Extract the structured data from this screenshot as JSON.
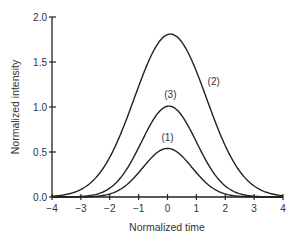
{
  "chart_data": {
    "type": "line",
    "title": "",
    "xlabel": "Normalized time",
    "ylabel": "Normalized intensity",
    "xlim": [
      -4,
      4
    ],
    "ylim": [
      0,
      2.0
    ],
    "xticks": [
      -4,
      -3,
      -2,
      -1,
      0,
      1,
      2,
      3,
      4
    ],
    "xtick_labels": [
      "−4",
      "−3",
      "−2",
      "−1",
      "0",
      "1",
      "2",
      "3",
      "4"
    ],
    "yticks": [
      0.0,
      0.5,
      1.0,
      1.5,
      2.0
    ],
    "ytick_labels": [
      "0.0",
      "0.5",
      "1.0",
      "1.5",
      "2.0"
    ],
    "grid": false,
    "legend": "none (inline curve labels)",
    "series": [
      {
        "name": "(1)",
        "peak": 0.54,
        "center": 0.0,
        "width": 0.85,
        "label_pos": [
          0.0,
          0.62
        ]
      },
      {
        "name": "(2)",
        "peak": 1.81,
        "center": 0.1,
        "width": 1.25,
        "label_pos": [
          1.25,
          1.25
        ]
      },
      {
        "name": "(3)",
        "peak": 1.01,
        "center": 0.05,
        "width": 0.95,
        "label_pos": [
          0.1,
          1.1
        ]
      }
    ],
    "annotations": [
      "(1)",
      "(2)",
      "(3)"
    ]
  }
}
